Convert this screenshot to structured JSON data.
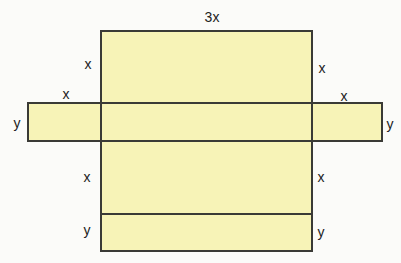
{
  "diagram": {
    "type": "net-of-rectangular-prism",
    "fill_color": "#f7f3b7",
    "stroke_color": "#3a3a36",
    "background_color": "#fbfbf9",
    "labels": {
      "top_width": "3x",
      "top_left_side": "x",
      "top_right_side": "x",
      "left_wing_top": "x",
      "right_wing_top": "x",
      "left_wing_side": "y",
      "right_wing_side": "y",
      "lower_left_side": "x",
      "lower_right_side": "x",
      "bottom_left_side": "y",
      "bottom_right_side": "y"
    }
  }
}
